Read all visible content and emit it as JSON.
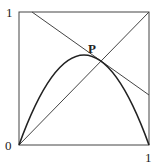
{
  "diagram": {
    "title": "",
    "labels": {
      "y_top": "1",
      "origin": "0",
      "x_right": "1",
      "point": "P"
    },
    "elements": [
      {
        "type": "square-frame",
        "description": "unit square from (0,0) to (1,1)"
      },
      {
        "type": "line",
        "description": "diagonal y = x from (0,0) to (1,1)"
      },
      {
        "type": "line",
        "description": "decreasing line from top edge (~0.1,1) to right edge (1,~0.38)"
      },
      {
        "type": "curve",
        "description": "concave parabola from (0,0) peaking near (0.5,0.68) to (1,0)"
      },
      {
        "type": "point",
        "label": "P",
        "description": "intersection/tangent point near (0.6,0.64)"
      }
    ],
    "colors": {
      "stroke": "#333333",
      "background": "#ffffff"
    }
  }
}
